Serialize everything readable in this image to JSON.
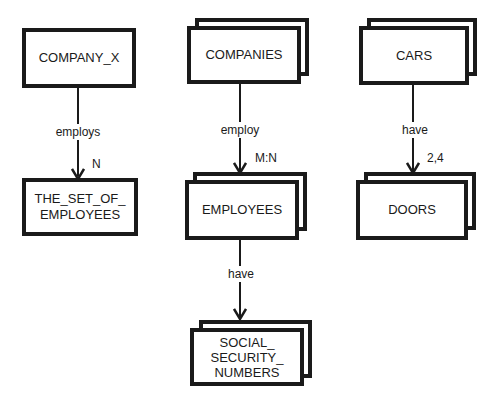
{
  "diagram": {
    "type": "entity-relationship",
    "entities": [
      {
        "id": "company_x",
        "label": "COMPANY_X",
        "multiple": false
      },
      {
        "id": "the_set_of_employees",
        "label": "THE_SET_OF_\nEMPLOYEES",
        "multiple": false
      },
      {
        "id": "companies",
        "label": "COMPANIES",
        "multiple": true
      },
      {
        "id": "employees",
        "label": "EMPLOYEES",
        "multiple": true
      },
      {
        "id": "social_security_numbers",
        "label": "SOCIAL_\nSECURITY_\nNUMBERS",
        "multiple": true
      },
      {
        "id": "cars",
        "label": "CARS",
        "multiple": true
      },
      {
        "id": "doors",
        "label": "DOORS",
        "multiple": true
      }
    ],
    "relationships": [
      {
        "from": "company_x",
        "to": "the_set_of_employees",
        "label": "employs",
        "cardinality": "N"
      },
      {
        "from": "companies",
        "to": "employees",
        "label": "employ",
        "cardinality": "M:N"
      },
      {
        "from": "employees",
        "to": "social_security_numbers",
        "label": "have",
        "cardinality": ""
      },
      {
        "from": "cars",
        "to": "doors",
        "label": "have",
        "cardinality": "2,4"
      }
    ]
  }
}
